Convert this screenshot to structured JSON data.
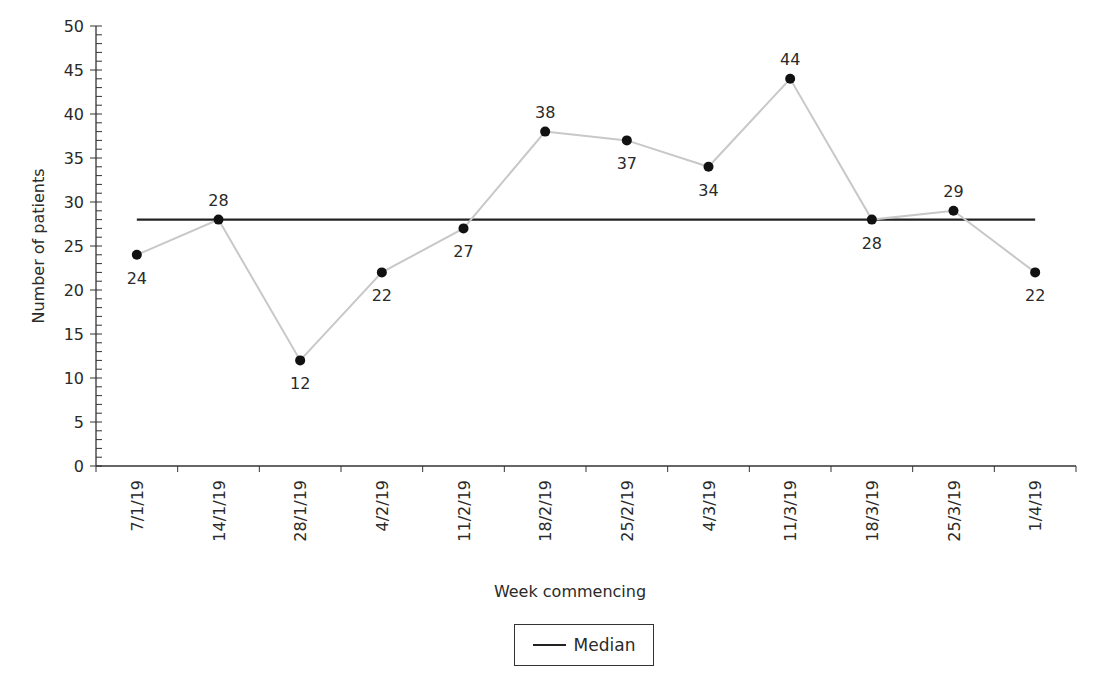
{
  "chart_data": {
    "type": "line",
    "title": "",
    "xlabel": "Week commencing",
    "ylabel": "Number of patients",
    "ylim": [
      0,
      50
    ],
    "yticks": [
      0,
      5,
      10,
      15,
      20,
      25,
      30,
      35,
      40,
      45,
      50
    ],
    "y_minor_tick_step": 1,
    "grid": false,
    "categories": [
      "7/1/19",
      "14/1/19",
      "28/1/19",
      "4/2/19",
      "11/2/19",
      "18/2/19",
      "25/2/19",
      "4/3/19",
      "11/3/19",
      "18/3/19",
      "25/3/19",
      "1/4/19"
    ],
    "series": [
      {
        "name": "Number of patients",
        "values": [
          24,
          28,
          12,
          22,
          27,
          38,
          37,
          34,
          44,
          28,
          29,
          22
        ],
        "label_position": [
          "below",
          "above",
          "below",
          "below",
          "below",
          "above",
          "below",
          "below",
          "above",
          "below",
          "above",
          "below"
        ],
        "color": "#c8c8c8",
        "marker_color": "#111111"
      },
      {
        "name": "Median",
        "values": [
          28,
          28,
          28,
          28,
          28,
          28,
          28,
          28,
          28,
          28,
          28,
          28
        ],
        "color": "#222222"
      }
    ],
    "legend": {
      "position": "bottom-center",
      "entries": [
        "Median"
      ]
    }
  },
  "axes": {
    "x_title": "Week commencing",
    "y_title": "Number of patients"
  },
  "legend": {
    "median_label": "Median"
  }
}
